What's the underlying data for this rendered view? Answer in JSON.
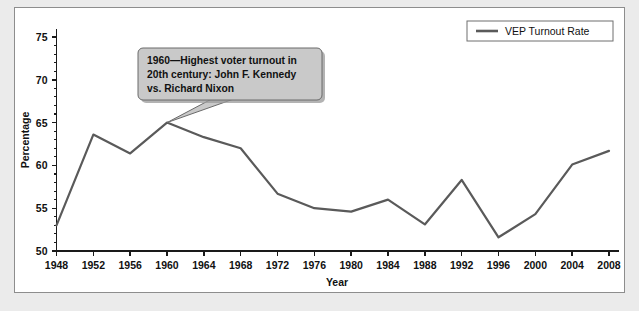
{
  "chart_data": {
    "type": "line",
    "title": "",
    "xlabel": "Year",
    "ylabel": "Percentage",
    "xlim": [
      1948,
      2008
    ],
    "ylim": [
      50,
      75
    ],
    "ytick_step": 5,
    "xtick_step": 4,
    "grid": false,
    "legend_position": "top-right",
    "categories": [
      1948,
      1952,
      1956,
      1960,
      1964,
      1968,
      1972,
      1976,
      1980,
      1984,
      1988,
      1992,
      1996,
      2000,
      2004,
      2008
    ],
    "series": [
      {
        "name": "VEP Turnout Rate",
        "color": "#5a5a5a",
        "values": [
          53.0,
          63.6,
          61.4,
          65.0,
          63.3,
          62.0,
          56.7,
          55.0,
          54.6,
          56.0,
          53.1,
          58.3,
          51.6,
          54.3,
          60.1,
          61.7
        ]
      }
    ],
    "xtick_labels": [
      "1948",
      "1952",
      "1956",
      "1960",
      "1964",
      "1968",
      "1972",
      "1976",
      "1980",
      "1984",
      "1988",
      "1992",
      "1996",
      "2000",
      "2004",
      "2008"
    ],
    "ytick_labels": [
      "50",
      "55",
      "60",
      "65",
      "70",
      "75"
    ],
    "ytick_values": [
      50,
      55,
      60,
      65,
      70,
      75
    ],
    "annotations": [
      {
        "id": "callout-1960",
        "target_year": 1960,
        "target_value": 65.0,
        "lines": [
          "1960—Highest voter turnout in",
          "20th century: John F. Kennedy",
          "vs. Richard Nixon"
        ]
      }
    ]
  },
  "legend": {
    "entries": [
      {
        "label": "VEP Turnout Rate",
        "color": "#5a5a5a"
      }
    ]
  },
  "axes": {
    "x_title": "Year",
    "y_title": "Percentage"
  },
  "colors": {
    "page_background": "#ebebeb",
    "figure_background": "#ffffff",
    "figure_border": "#8d8d8d",
    "line": "#5a5a5a",
    "callout_fill": "#c9c9c9",
    "callout_border": "#6a6a6a",
    "axis": "#1a1a1a",
    "text": "#111111"
  }
}
